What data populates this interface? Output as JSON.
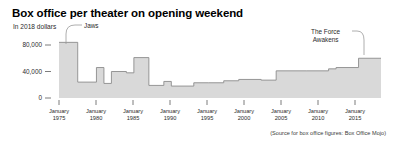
{
  "title": "Box office per theater on opening weekend",
  "subtitle": "In 2018 dollars",
  "source": "(Source for box office figures: Box Office Mojo)",
  "annotations": {
    "jaws": "Jaws",
    "force_awakens_line1": "The Force",
    "force_awakens_line2": "Awakens"
  },
  "axis": {
    "y_ticks": [
      "80,000",
      "40,000",
      "0"
    ],
    "x_month": "January",
    "x_years": [
      "1975",
      "1980",
      "1985",
      "1990",
      "1995",
      "2000",
      "2005",
      "2010",
      "2015"
    ]
  },
  "colors": {
    "area_fill": "#d9d9d9",
    "step_line": "#8c8c8c",
    "axis": "#6e6e6e",
    "text": "#2b2b2b",
    "title": "#000000"
  },
  "chart_data": {
    "type": "area",
    "subtype": "step-area",
    "title": "Box office per theater on opening weekend",
    "subtitle": "In 2018 dollars",
    "xlabel": "",
    "ylabel": "In 2018 dollars",
    "ylim": [
      0,
      90000
    ],
    "xlim": [
      1975,
      2018
    ],
    "grid": false,
    "legend": false,
    "y_tick_values": [
      0,
      40000,
      80000
    ],
    "x_tick_values": [
      1975,
      1980,
      1985,
      1990,
      1995,
      2000,
      2005,
      2010,
      2015
    ],
    "note": "Step chart: each value holds until the next record-setting opening weekend per-theater gross.",
    "steps": [
      {
        "year": 1975,
        "value": 84000,
        "film": "Jaws"
      },
      {
        "year": 1977.5,
        "value": 24000,
        "film": ""
      },
      {
        "year": 1980,
        "value": 46000,
        "film": ""
      },
      {
        "year": 1981,
        "value": 22000,
        "film": ""
      },
      {
        "year": 1982,
        "value": 40000,
        "film": ""
      },
      {
        "year": 1984,
        "value": 38000,
        "film": ""
      },
      {
        "year": 1985,
        "value": 61000,
        "film": ""
      },
      {
        "year": 1987,
        "value": 19000,
        "film": ""
      },
      {
        "year": 1989,
        "value": 25000,
        "film": ""
      },
      {
        "year": 1990,
        "value": 18000,
        "film": ""
      },
      {
        "year": 1993,
        "value": 23000,
        "film": ""
      },
      {
        "year": 1995,
        "value": 23000,
        "film": ""
      },
      {
        "year": 1997,
        "value": 26000,
        "film": ""
      },
      {
        "year": 1999,
        "value": 28000,
        "film": ""
      },
      {
        "year": 2002,
        "value": 27000,
        "film": ""
      },
      {
        "year": 2004,
        "value": 41000,
        "film": ""
      },
      {
        "year": 2008,
        "value": 41000,
        "film": ""
      },
      {
        "year": 2011,
        "value": 44000,
        "film": ""
      },
      {
        "year": 2012,
        "value": 46000,
        "film": ""
      },
      {
        "year": 2015,
        "value": 60000,
        "film": "The Force Awakens"
      },
      {
        "year": 2018,
        "value": 60000,
        "film": ""
      }
    ]
  }
}
